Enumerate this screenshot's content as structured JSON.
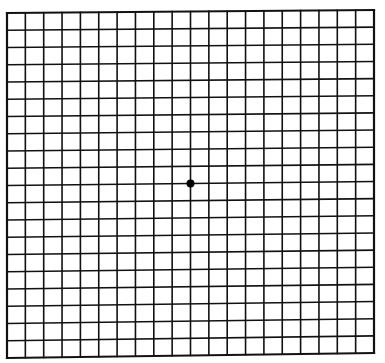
{
  "diagram": {
    "type": "amsler-grid",
    "rows": 20,
    "columns": 20,
    "grid": {
      "left": 7,
      "top": 13,
      "width": 367,
      "height": 342
    },
    "skew": {
      "top_right_dy": -3,
      "bottom_left_dy": 3
    },
    "line_color": "#111111",
    "line_width": 1.6,
    "border_width": 2.2,
    "background": "#ffffff",
    "fixation_point": {
      "row": 10,
      "column": 10,
      "radius": 4,
      "color": "#000000"
    }
  }
}
